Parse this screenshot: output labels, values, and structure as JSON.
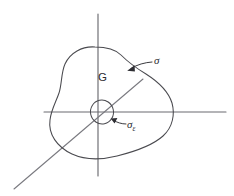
{
  "figure": {
    "background_color": "#ffffff",
    "width": 234,
    "height": 196,
    "axis_color": "#6b6b70",
    "curve_color": "#4a4a4f",
    "label_color": "#2b2b30"
  },
  "labels": {
    "region": "G",
    "outer_boundary": "σ",
    "inner_boundary_base": "σ",
    "inner_boundary_subscript": "ε"
  },
  "axes": {
    "vertical": {
      "name": "vertical-axis",
      "x": 98,
      "y_top": 14,
      "y_bottom": 176
    },
    "horizontal": {
      "name": "horizontal-axis",
      "y": 112,
      "x_left": 44,
      "x_right": 226
    },
    "depth": {
      "name": "depth-axis",
      "x_start": 143,
      "y_start": 79,
      "x_end": 14,
      "y_end": 189
    }
  },
  "shapes": {
    "outer_boundary": {
      "name": "sigma-boundary-curve",
      "path": "M 95 47 C 77 47 66 58 63 70 C 61 79 62 88 59 97 C 55 108 50 118 50 128 C 50 141 61 152 78 157 C 93 161 108 159 124 154 C 140 149 158 142 167 131 C 175 121 174 110 171 100 C 167 88 158 80 147 73 C 135 65 127 60 120 53 C 113 47 105 47 95 47 Z"
    },
    "inner_boundary": {
      "name": "sigma-epsilon-boundary-ellipse",
      "cx": 102,
      "cy": 112,
      "rx": 11.5,
      "ry": 12
    },
    "outer_leader": {
      "name": "sigma-leader-line",
      "path": "M 152 62 C 145 62 137 64 130 69",
      "arrow_tip_x": 128,
      "arrow_tip_y": 70.5
    },
    "inner_leader": {
      "name": "sigma-epsilon-leader-line",
      "path": "M 126 124 C 122 124 117 123 113 120",
      "arrow_tip_x": 111,
      "arrow_tip_y": 119
    }
  }
}
